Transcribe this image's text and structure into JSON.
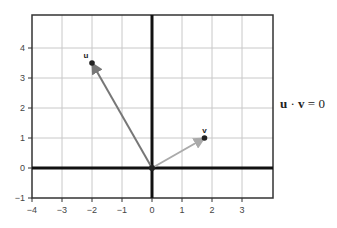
{
  "chart_data": {
    "type": "vector",
    "title": "",
    "xlabel": "",
    "ylabel": "",
    "xlim": [
      -4,
      4
    ],
    "ylim": [
      -1,
      5.1
    ],
    "grid": true,
    "x_ticks": [
      -4,
      -3,
      -2,
      -1,
      0,
      1,
      2,
      3
    ],
    "y_ticks": [
      -1,
      0,
      1,
      2,
      3,
      4
    ],
    "x_tick_labels": [
      "−4",
      "−3",
      "−2",
      "−1",
      "0",
      "1",
      "2",
      "3"
    ],
    "y_tick_labels": [
      "−1",
      "0",
      "1",
      "2",
      "3",
      "4"
    ],
    "series": [
      {
        "name": "u",
        "label": "u",
        "origin": [
          0,
          0
        ],
        "tip": [
          -2,
          3.5
        ],
        "color": "#777777"
      },
      {
        "name": "v",
        "label": "v",
        "origin": [
          0,
          0
        ],
        "tip": [
          1.75,
          1.0
        ],
        "color": "#aaaaaa"
      }
    ],
    "annotations": [
      {
        "text": "u · v = 0",
        "position": "right of plot"
      }
    ]
  },
  "equation": {
    "u": "u",
    "dot": " · ",
    "v": "v",
    "rest": " = 0"
  }
}
